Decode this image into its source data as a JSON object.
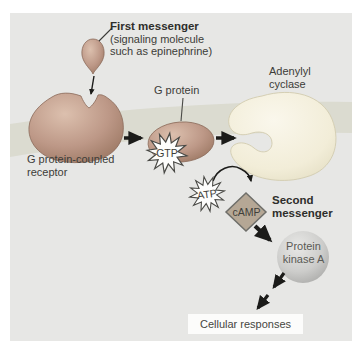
{
  "nodes": {
    "first_messenger": {
      "title": "First messenger",
      "subtitle1": "(signaling molecule",
      "subtitle2": "such as epinephrine)"
    },
    "receptor": {
      "label1": "G protein-coupled",
      "label2": "receptor"
    },
    "g_protein": {
      "label": "G protein",
      "gtp": "GTP"
    },
    "adenylyl_cyclase": {
      "label1": "Adenylyl",
      "label2": "cyclase"
    },
    "atp": {
      "label": "ATP"
    },
    "camp": {
      "label": "cAMP",
      "title1": "Second",
      "title2": "messenger"
    },
    "pka": {
      "label1": "Protein",
      "label2": "kinase A"
    },
    "cellular_responses": {
      "label": "Cellular responses"
    }
  },
  "colors": {
    "panel_bg": "#e7e7e5",
    "membrane": "#dbdbd0",
    "protein_tan": "#bd9887",
    "adenylyl_cream": "#f2edd8",
    "camp_fill": "#b5a795",
    "pka_sphere": "#cbcbc9",
    "starburst_fill": "#fdfdfc",
    "arrow": "#1b1b19",
    "text": "#3a3a38"
  }
}
